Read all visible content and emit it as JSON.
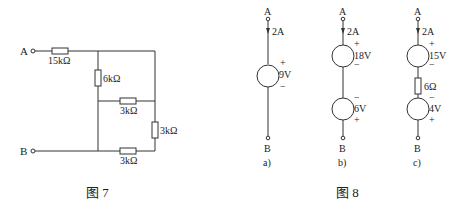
{
  "figure7": {
    "caption": "图  7",
    "terminal_a": "A",
    "terminal_b": "B",
    "resistors": {
      "series_input": "15kΩ",
      "vertical_left": "6kΩ",
      "middle_horizontal": "3kΩ",
      "right_vertical": "3kΩ",
      "bottom_horizontal": "3kΩ"
    }
  },
  "figure8": {
    "caption": "图  8",
    "circuits": [
      {
        "sub_label": "a)",
        "top": "A",
        "bottom": "B",
        "current": "2A",
        "sources": [
          {
            "value": "9V",
            "top_sign": "+",
            "bottom_sign": "−"
          }
        ]
      },
      {
        "sub_label": "b)",
        "top": "A",
        "bottom": "B",
        "current": "2A",
        "sources": [
          {
            "value": "18V",
            "top_sign": "+",
            "bottom_sign": "−"
          },
          {
            "value": "6V",
            "top_sign": "−",
            "bottom_sign": "+"
          }
        ]
      },
      {
        "sub_label": "c)",
        "top": "A",
        "bottom": "B",
        "current": "2A",
        "resistor": "6Ω",
        "sources": [
          {
            "value": "15V",
            "top_sign": "+",
            "bottom_sign": "−"
          },
          {
            "value": "4V",
            "top_sign": "−",
            "bottom_sign": "+"
          }
        ]
      }
    ]
  }
}
